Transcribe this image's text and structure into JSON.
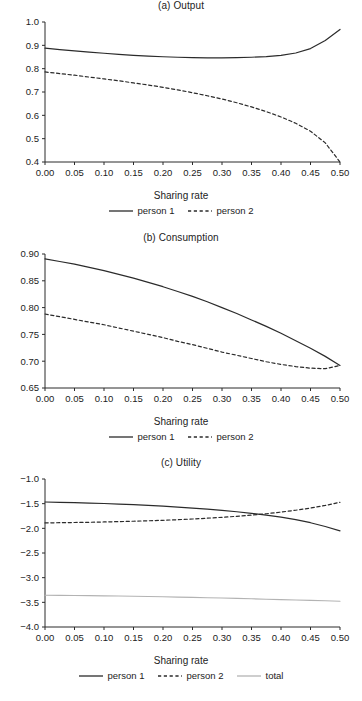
{
  "figure": {
    "background": "#ffffff",
    "line_colors": {
      "person1": "#2b2b2b",
      "person2": "#2b2b2b",
      "total": "#b3b3b3"
    }
  },
  "panels": [
    {
      "key": "a",
      "title": "(a) Output",
      "xlabel": "Sharing rate",
      "legend": [
        {
          "label": "person 1",
          "style": "solid"
        },
        {
          "label": "person 2",
          "style": "dashed"
        }
      ],
      "yticks": [
        "0.4",
        "0.5",
        "0.6",
        "0.7",
        "0.8",
        "0.9",
        "1.0"
      ],
      "xticks": [
        "0.00",
        "0.05",
        "0.10",
        "0.15",
        "0.20",
        "0.25",
        "0.30",
        "0.35",
        "0.40",
        "0.45",
        "0.50"
      ]
    },
    {
      "key": "b",
      "title": "(b) Consumption",
      "xlabel": "Sharing rate",
      "legend": [
        {
          "label": "person 1",
          "style": "solid"
        },
        {
          "label": "person 2",
          "style": "dashed"
        }
      ],
      "yticks": [
        "0.65",
        "0.70",
        "0.75",
        "0.80",
        "0.85",
        "0.90"
      ],
      "xticks": [
        "0.00",
        "0.05",
        "0.10",
        "0.15",
        "0.20",
        "0.25",
        "0.30",
        "0.35",
        "0.40",
        "0.45",
        "0.50"
      ]
    },
    {
      "key": "c",
      "title": "(c) Utility",
      "xlabel": "Sharing rate",
      "legend": [
        {
          "label": "person 1",
          "style": "solid"
        },
        {
          "label": "person 2",
          "style": "dashed"
        },
        {
          "label": "total",
          "style": "solid-gray"
        }
      ],
      "yticks": [
        "−4.0",
        "−3.5",
        "−3.0",
        "−2.5",
        "−2.0",
        "−1.5",
        "−1.0"
      ],
      "xticks": [
        "0.00",
        "0.05",
        "0.10",
        "0.15",
        "0.20",
        "0.25",
        "0.30",
        "0.35",
        "0.40",
        "0.45",
        "0.50"
      ]
    }
  ],
  "chart_data": [
    {
      "type": "line",
      "title": "(a) Output",
      "xlabel": "Sharing rate",
      "ylabel": "",
      "xlim": [
        0.0,
        0.5
      ],
      "ylim": [
        0.4,
        1.0
      ],
      "xticks": [
        0.0,
        0.05,
        0.1,
        0.15,
        0.2,
        0.25,
        0.3,
        0.35,
        0.4,
        0.45,
        0.5
      ],
      "yticks": [
        0.4,
        0.5,
        0.6,
        0.7,
        0.8,
        0.9,
        1.0
      ],
      "grid": false,
      "legend_position": "below",
      "x": [
        0.0,
        0.025,
        0.05,
        0.075,
        0.1,
        0.125,
        0.15,
        0.175,
        0.2,
        0.225,
        0.25,
        0.275,
        0.3,
        0.325,
        0.35,
        0.375,
        0.4,
        0.425,
        0.45,
        0.475,
        0.5
      ],
      "series": [
        {
          "name": "person 1",
          "style": "solid",
          "values": [
            0.888,
            0.882,
            0.876,
            0.871,
            0.866,
            0.861,
            0.857,
            0.854,
            0.851,
            0.849,
            0.847,
            0.846,
            0.846,
            0.847,
            0.849,
            0.852,
            0.857,
            0.867,
            0.886,
            0.921,
            0.968
          ]
        },
        {
          "name": "person 2",
          "style": "dashed",
          "values": [
            0.786,
            0.779,
            0.772,
            0.764,
            0.756,
            0.748,
            0.739,
            0.73,
            0.72,
            0.709,
            0.697,
            0.684,
            0.67,
            0.654,
            0.636,
            0.616,
            0.593,
            0.566,
            0.532,
            0.482,
            0.4
          ]
        }
      ]
    },
    {
      "type": "line",
      "title": "(b) Consumption",
      "xlabel": "Sharing rate",
      "ylabel": "",
      "xlim": [
        0.0,
        0.5
      ],
      "ylim": [
        0.65,
        0.9
      ],
      "xticks": [
        0.0,
        0.05,
        0.1,
        0.15,
        0.2,
        0.25,
        0.3,
        0.35,
        0.4,
        0.45,
        0.5
      ],
      "yticks": [
        0.65,
        0.7,
        0.75,
        0.8,
        0.85,
        0.9
      ],
      "grid": false,
      "legend_position": "below",
      "x": [
        0.0,
        0.025,
        0.05,
        0.075,
        0.1,
        0.125,
        0.15,
        0.175,
        0.2,
        0.225,
        0.25,
        0.275,
        0.3,
        0.325,
        0.35,
        0.375,
        0.4,
        0.425,
        0.45,
        0.475,
        0.5
      ],
      "series": [
        {
          "name": "person 1",
          "style": "solid",
          "values": [
            0.891,
            0.886,
            0.881,
            0.875,
            0.869,
            0.862,
            0.855,
            0.847,
            0.839,
            0.83,
            0.821,
            0.811,
            0.8,
            0.789,
            0.777,
            0.765,
            0.752,
            0.738,
            0.724,
            0.709,
            0.692
          ]
        },
        {
          "name": "person 2",
          "style": "dashed",
          "values": [
            0.788,
            0.783,
            0.778,
            0.773,
            0.768,
            0.762,
            0.756,
            0.75,
            0.744,
            0.737,
            0.731,
            0.724,
            0.717,
            0.711,
            0.705,
            0.699,
            0.694,
            0.69,
            0.687,
            0.686,
            0.692
          ]
        }
      ]
    },
    {
      "type": "line",
      "title": "(c) Utility",
      "xlabel": "Sharing rate",
      "ylabel": "",
      "xlim": [
        0.0,
        0.5
      ],
      "ylim": [
        -4.0,
        -1.0
      ],
      "xticks": [
        0.0,
        0.05,
        0.1,
        0.15,
        0.2,
        0.25,
        0.3,
        0.35,
        0.4,
        0.45,
        0.5
      ],
      "yticks": [
        -4.0,
        -3.5,
        -3.0,
        -2.5,
        -2.0,
        -1.5,
        -1.0
      ],
      "grid": false,
      "legend_position": "below",
      "x": [
        0.0,
        0.025,
        0.05,
        0.075,
        0.1,
        0.125,
        0.15,
        0.175,
        0.2,
        0.225,
        0.25,
        0.275,
        0.3,
        0.325,
        0.35,
        0.375,
        0.4,
        0.425,
        0.45,
        0.475,
        0.5
      ],
      "series": [
        {
          "name": "person 1",
          "style": "solid",
          "values": [
            -1.466,
            -1.472,
            -1.479,
            -1.487,
            -1.497,
            -1.508,
            -1.521,
            -1.535,
            -1.551,
            -1.569,
            -1.589,
            -1.611,
            -1.636,
            -1.664,
            -1.696,
            -1.732,
            -1.774,
            -1.824,
            -1.886,
            -1.962,
            -2.05
          ]
        },
        {
          "name": "person 2",
          "style": "dashed",
          "values": [
            -1.89,
            -1.886,
            -1.882,
            -1.877,
            -1.871,
            -1.864,
            -1.856,
            -1.847,
            -1.837,
            -1.825,
            -1.811,
            -1.795,
            -1.777,
            -1.756,
            -1.732,
            -1.704,
            -1.671,
            -1.633,
            -1.589,
            -1.536,
            -1.472
          ]
        },
        {
          "name": "total",
          "style": "solid-gray",
          "values": [
            -3.356,
            -3.359,
            -3.362,
            -3.365,
            -3.369,
            -3.373,
            -3.377,
            -3.382,
            -3.388,
            -3.394,
            -3.4,
            -3.406,
            -3.413,
            -3.42,
            -3.428,
            -3.436,
            -3.445,
            -3.453,
            -3.461,
            -3.469,
            -3.478
          ]
        }
      ]
    }
  ]
}
